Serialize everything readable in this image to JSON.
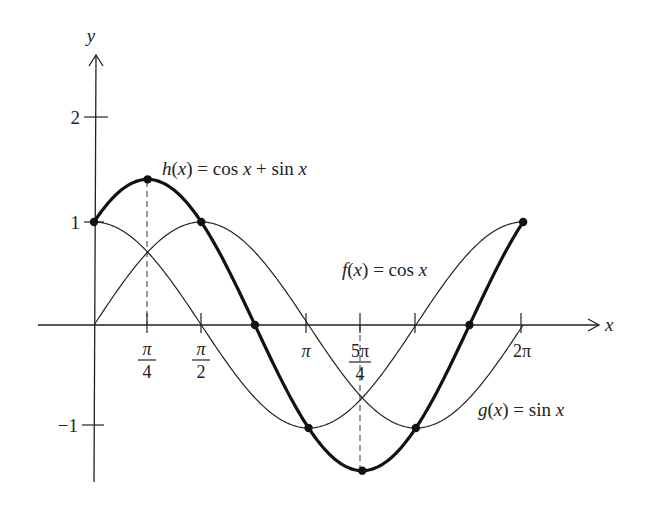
{
  "chart_data": {
    "type": "line",
    "title": "",
    "xlabel": "x",
    "ylabel": "y",
    "xlim": [
      0,
      6.2832
    ],
    "ylim": [
      -1.5,
      2.3
    ],
    "grid": false,
    "x_ticks": [
      {
        "value": 0.7854,
        "label_num": "π",
        "label_den": "4"
      },
      {
        "value": 1.5708,
        "label_num": "π",
        "label_den": "2"
      },
      {
        "value": 3.1416,
        "label": "π"
      },
      {
        "value": 3.927,
        "label_num": "5π",
        "label_den": "4"
      },
      {
        "value": 6.2832,
        "label": "2π"
      }
    ],
    "y_ticks": [
      {
        "value": 2,
        "label": "2"
      },
      {
        "value": 1,
        "label": "1"
      },
      {
        "value": -1,
        "label": "−1"
      }
    ],
    "series": [
      {
        "name": "f(x) = cos x",
        "function": "cos x",
        "style": "thin",
        "label_parts": [
          "f",
          "(",
          "x",
          ")",
          " = cos ",
          "x"
        ]
      },
      {
        "name": "g(x) = sin x",
        "function": "sin x",
        "style": "thin",
        "label_parts": [
          "g",
          "(",
          "x",
          ")",
          " = sin ",
          "x"
        ]
      },
      {
        "name": "h(x) = cos x + sin x",
        "function": "cos x + sin x",
        "style": "bold",
        "label_parts": [
          "h",
          "(",
          "x",
          ")",
          " = cos ",
          "x",
          " + sin ",
          "x"
        ]
      }
    ],
    "highlighted_points": [
      {
        "x": 0,
        "y": 1
      },
      {
        "x": 0.7854,
        "y": 1.4142
      },
      {
        "x": 1.5708,
        "y": 1
      },
      {
        "x": 2.3562,
        "y": 0
      },
      {
        "x": 3.1416,
        "y": -1
      },
      {
        "x": 3.927,
        "y": -1.4142
      },
      {
        "x": 4.7124,
        "y": -1
      },
      {
        "x": 5.4978,
        "y": 0
      },
      {
        "x": 6.2832,
        "y": 1
      }
    ],
    "dashed_guides": [
      {
        "x": 0.7854,
        "from_y": 0,
        "to_y": 1.4142
      },
      {
        "x": 3.927,
        "from_y": 0,
        "to_y": -1.4142
      }
    ]
  },
  "labels": {
    "y_axis": "y",
    "x_axis": "x",
    "tick_2": "2",
    "tick_1": "1",
    "tick_m1": "−1",
    "pi_over_4_num": "π",
    "pi_over_4_den": "4",
    "pi_over_2_num": "π",
    "pi_over_2_den": "2",
    "pi": "π",
    "five_pi_over_4_num": "5π",
    "five_pi_over_4_den": "4",
    "two_pi": "2π",
    "h_name": "h",
    "h_rest": " = cos ",
    "h_plus": " + sin ",
    "f_name": "f",
    "f_rest": " = cos ",
    "g_name": "g",
    "g_rest": " = sin ",
    "var_x": "x",
    "paren_open": "(",
    "paren_close": ")"
  }
}
